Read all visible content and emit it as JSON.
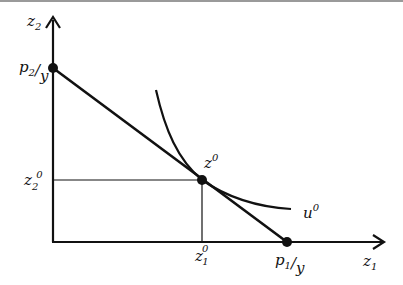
{
  "diagram": {
    "type": "consumer-choice-budget-indifference",
    "axes": {
      "x": {
        "label": "z",
        "sub": "1"
      },
      "y": {
        "label": "z",
        "sub": "2"
      }
    },
    "intercepts": {
      "y_intercept": {
        "p": "p",
        "p_sub": "2",
        "slash": "/",
        "y": "y"
      },
      "x_intercept": {
        "p": "p",
        "p_sub": "1",
        "slash": "/",
        "y": "y"
      }
    },
    "optimum": {
      "label": "z",
      "sup": "0"
    },
    "optimum_x": {
      "label": "z",
      "sub": "1",
      "sup": "0"
    },
    "optimum_y": {
      "label": "z",
      "sub": "2",
      "sup": "0"
    },
    "indifference_curve": {
      "label": "u",
      "sup": "0"
    },
    "colors": {
      "line": "#111111",
      "border": "#999999",
      "background": "#ffffff"
    }
  }
}
